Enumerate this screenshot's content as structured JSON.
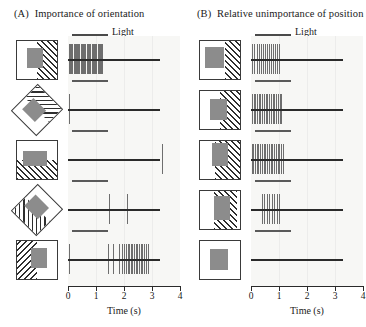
{
  "panels": [
    {
      "tag": "(A)",
      "title": "Importance of orientation",
      "legend_label": "Light",
      "axis": {
        "label": "Time (s)",
        "ticks": [
          "0",
          "1",
          "2",
          "3",
          "4"
        ],
        "min": 0,
        "max": 4
      },
      "rows": [
        {
          "stim": "vertical-bar-hatch-right",
          "rotation": 0
        },
        {
          "stim": "diagonal-bar-hatch-right",
          "rotation": -45
        },
        {
          "stim": "horizontal-bar-hatch-bottom",
          "rotation": 0
        },
        {
          "stim": "diagonal-bar-hatch-left",
          "rotation": -45
        },
        {
          "stim": "vertical-bar-hatch-left",
          "rotation": 0
        }
      ]
    },
    {
      "tag": "(B)",
      "title": "Relative unimportance of position",
      "legend_label": "Light",
      "axis": {
        "label": "Time (s)",
        "ticks": [
          "0",
          "1",
          "2",
          "3",
          "4"
        ],
        "min": 0,
        "max": 4
      },
      "rows": [
        {
          "stim": "bar-position-1",
          "rotation": 0
        },
        {
          "stim": "bar-position-2",
          "rotation": 0
        },
        {
          "stim": "bar-position-3",
          "rotation": 0
        },
        {
          "stim": "bar-position-4",
          "rotation": 0
        },
        {
          "stim": "no-bar-blank",
          "rotation": 0
        }
      ]
    }
  ],
  "chart_data": {
    "type": "scatter",
    "xlabel": "Time (s)",
    "ylabel": "",
    "xlim": [
      0,
      4
    ],
    "grid": false,
    "legend": [
      "Light"
    ],
    "legend_position": "top",
    "light_bar": {
      "start": 0.0,
      "end": 3.3
    },
    "panels": [
      {
        "name": "(A) Importance of orientation",
        "rows": [
          {
            "stimulus": "vertical bar, hatch right",
            "spike_times": [
              0.02,
              0.07,
              0.11,
              0.15,
              0.2,
              0.24,
              0.28,
              0.32,
              0.37,
              0.41,
              0.45,
              0.5,
              0.54,
              0.58,
              0.62,
              0.67,
              0.71,
              0.75,
              0.8,
              0.84,
              0.88,
              0.93,
              0.97,
              1.01,
              1.06,
              1.1,
              1.14,
              1.19,
              1.23
            ],
            "spike_count": 29
          },
          {
            "stimulus": "bar rotated -45 deg, hatch right",
            "spike_times": [
              0.05
            ],
            "spike_count": 1
          },
          {
            "stimulus": "horizontal bar, hatch bottom",
            "spike_times": [
              3.35
            ],
            "spike_count": 1
          },
          {
            "stimulus": "bar rotated -45 deg, hatch left",
            "spike_times": [
              1.45,
              2.12
            ],
            "spike_count": 2
          },
          {
            "stimulus": "vertical bar, hatch left",
            "spike_times": [
              0.02,
              1.42,
              1.62,
              1.82,
              1.92,
              2.0,
              2.07,
              2.13,
              2.19,
              2.25,
              2.3,
              2.36,
              2.42,
              2.48,
              2.54,
              2.6,
              2.66,
              2.72,
              2.78,
              2.84
            ],
            "spike_count": 20
          }
        ]
      },
      {
        "name": "(B) Relative unimportance of position",
        "rows": [
          {
            "stimulus": "bar at position 1",
            "spike_times": [
              0.05,
              0.12,
              0.2,
              0.27,
              0.34,
              0.42,
              0.49,
              0.56,
              0.64,
              0.71,
              0.79,
              0.86,
              0.93,
              1.0
            ],
            "spike_count": 14
          },
          {
            "stimulus": "bar at position 2",
            "spike_times": [
              0.03,
              0.09,
              0.15,
              0.21,
              0.27,
              0.33,
              0.4,
              0.46,
              0.52,
              0.58,
              0.64,
              0.7,
              0.77,
              0.83,
              0.89,
              0.95,
              1.02,
              1.08
            ],
            "spike_count": 18
          },
          {
            "stimulus": "bar at position 3",
            "spike_times": [
              0.02,
              0.08,
              0.14,
              0.2,
              0.26,
              0.33,
              0.39,
              0.45,
              0.51,
              0.57,
              0.64,
              0.7,
              0.76,
              0.82,
              0.88,
              0.95,
              1.01,
              1.07,
              1.13
            ],
            "spike_count": 19
          },
          {
            "stimulus": "bar at position 4",
            "spike_times": [
              0.38,
              0.47,
              0.56,
              0.65,
              0.74,
              0.83,
              0.92,
              1.01
            ],
            "spike_count": 8
          },
          {
            "stimulus": "no bar (blank gray square)",
            "spike_times": [],
            "spike_count": 0
          }
        ]
      }
    ]
  }
}
